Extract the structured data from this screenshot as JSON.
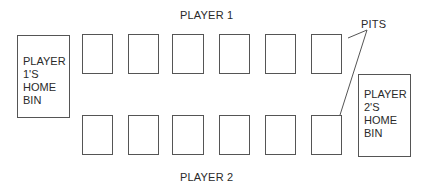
{
  "diagram": {
    "title_top": "PLAYER 1",
    "title_bottom": "PLAYER 2",
    "callout": "PITS",
    "player1_bin": {
      "lines": [
        "PLAYER",
        "1'S",
        "HOME",
        "BIN"
      ]
    },
    "player2_bin": {
      "lines": [
        "PLAYER",
        "2'S",
        "HOME",
        "BIN"
      ]
    },
    "top_row_pits": 6,
    "bottom_row_pits": 6
  }
}
